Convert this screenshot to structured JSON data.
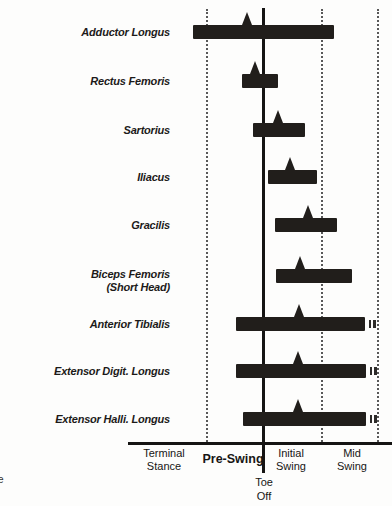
{
  "figure": {
    "caption_fragment": "e"
  },
  "chart_data": {
    "type": "bar",
    "subtype": "muscle-activity-timing (horizontal gantt bars with peak-activity triangle markers)",
    "title": "",
    "xlabel_units": "px positions along the gait-phase timeline; phase boundaries given below",
    "phases": [
      {
        "label": "Terminal\nStance",
        "x_start": 128,
        "x_end": 207,
        "label_x": 164,
        "bold": false
      },
      {
        "label": "Pre-Swing",
        "x_start": 207,
        "x_end": 264,
        "label_x": 233,
        "bold": true
      },
      {
        "label": "Initial\nSwing",
        "x_start": 264,
        "x_end": 322,
        "label_x": 291,
        "bold": false
      },
      {
        "label": "Mid\nSwing",
        "x_start": 322,
        "x_end": 378,
        "label_x": 352,
        "bold": false
      }
    ],
    "event_marker": {
      "label": "Toe\nOff",
      "x": 264
    },
    "axis": {
      "baseline_y": 442,
      "x_start": 128,
      "x_end": 392,
      "gridline_xs": [
        207,
        322,
        378
      ],
      "grid_top_y": 9,
      "solid_line_x": 263,
      "solid_line_top_y": 8,
      "solid_line_bottom_y": 473
    },
    "muscles": [
      {
        "name": "Adductor Longus",
        "bar_start": 193,
        "bar_end": 334,
        "peak_x": 247,
        "row_center_y": 32,
        "continues": false,
        "label_dy": 0
      },
      {
        "name": "Rectus Femoris",
        "bar_start": 242,
        "bar_end": 278,
        "peak_x": 255,
        "row_center_y": 81,
        "continues": false,
        "label_dy": 0
      },
      {
        "name": "Sartorius",
        "bar_start": 253,
        "bar_end": 305,
        "peak_x": 278,
        "row_center_y": 130,
        "continues": false,
        "label_dy": 0
      },
      {
        "name": "Iliacus",
        "bar_start": 268,
        "bar_end": 317,
        "peak_x": 290,
        "row_center_y": 177,
        "continues": false,
        "label_dy": 0
      },
      {
        "name": "Gracilis",
        "bar_start": 275,
        "bar_end": 337,
        "peak_x": 308,
        "row_center_y": 225,
        "continues": false,
        "label_dy": 0
      },
      {
        "name": "Biceps Femoris\n(Short Head)",
        "bar_start": 276,
        "bar_end": 352,
        "peak_x": 300,
        "row_center_y": 276,
        "continues": false,
        "label_dy": 5
      },
      {
        "name": "Anterior Tibialis",
        "bar_start": 236,
        "bar_end": 365,
        "peak_x": 299,
        "row_center_y": 324,
        "continues": true,
        "label_dy": 0
      },
      {
        "name": "Extensor Digit. Longus",
        "bar_start": 236,
        "bar_end": 366,
        "peak_x": 298,
        "row_center_y": 371,
        "continues": true,
        "label_dy": 0
      },
      {
        "name": "Extensor Halli. Longus",
        "bar_start": 243,
        "bar_end": 366,
        "peak_x": 298,
        "row_center_y": 419,
        "continues": true,
        "label_dy": 0
      }
    ],
    "style": {
      "bar_color": "#211e1b",
      "line_color": "#151413",
      "grid_color": "#585858",
      "bar_height": 14,
      "peak_width": 10,
      "peak_height": 13
    },
    "legend": "none",
    "grid": "vertical dotted phase-boundary lines"
  }
}
